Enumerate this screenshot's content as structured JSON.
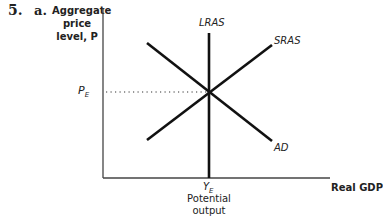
{
  "question": {
    "number": "5.",
    "part": "a."
  },
  "axes": {
    "y_label_line1": "Aggregate",
    "y_label_line2": "price",
    "y_label_line3": "level, P",
    "x_label": "Real GDP"
  },
  "curves": {
    "lras": "LRAS",
    "sras": "SRAS",
    "ad": "AD"
  },
  "equilibrium": {
    "price_label": "P",
    "price_sub": "E",
    "output_label": "Y",
    "output_sub": "E",
    "output_desc_line1": "Potential",
    "output_desc_line2": "output"
  }
}
